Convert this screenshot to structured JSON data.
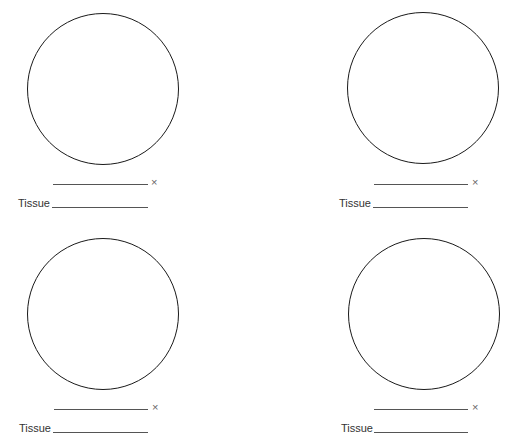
{
  "worksheet": {
    "panels": [
      {
        "id": "top-left",
        "circle": {
          "cx": 103,
          "cy": 89,
          "r": 76
        },
        "mag_value": "",
        "times_symbol": "×",
        "tissue_label": "Tissue",
        "tissue_value": "",
        "mag_line": {
          "x1": 53,
          "x2": 148,
          "y": 184
        },
        "times_pos": {
          "x": 151,
          "y": 177
        },
        "tissue_pos": {
          "x": 18,
          "y": 198
        },
        "tissue_line": {
          "x1": 52,
          "x2": 148,
          "y": 207
        }
      },
      {
        "id": "top-right",
        "circle": {
          "cx": 423,
          "cy": 88,
          "r": 76
        },
        "mag_value": "",
        "times_symbol": "×",
        "tissue_label": "Tissue",
        "tissue_value": "",
        "mag_line": {
          "x1": 374,
          "x2": 468,
          "y": 184
        },
        "times_pos": {
          "x": 472,
          "y": 177
        },
        "tissue_pos": {
          "x": 339,
          "y": 198
        },
        "tissue_line": {
          "x1": 373,
          "x2": 468,
          "y": 207
        }
      },
      {
        "id": "bottom-left",
        "circle": {
          "cx": 103,
          "cy": 314,
          "r": 76
        },
        "mag_value": "",
        "times_symbol": "×",
        "tissue_label": "Tissue",
        "tissue_value": "",
        "mag_line": {
          "x1": 54,
          "x2": 148,
          "y": 409
        },
        "times_pos": {
          "x": 152,
          "y": 402
        },
        "tissue_pos": {
          "x": 19,
          "y": 423
        },
        "tissue_line": {
          "x1": 53,
          "x2": 148,
          "y": 432
        }
      },
      {
        "id": "bottom-right",
        "circle": {
          "cx": 424,
          "cy": 314,
          "r": 76
        },
        "mag_value": "",
        "times_symbol": "×",
        "tissue_label": "Tissue",
        "tissue_value": "",
        "mag_line": {
          "x1": 374,
          "x2": 468,
          "y": 409
        },
        "times_pos": {
          "x": 472,
          "y": 402
        },
        "tissue_pos": {
          "x": 341,
          "y": 423
        },
        "tissue_line": {
          "x1": 374,
          "x2": 468,
          "y": 432
        }
      }
    ]
  }
}
